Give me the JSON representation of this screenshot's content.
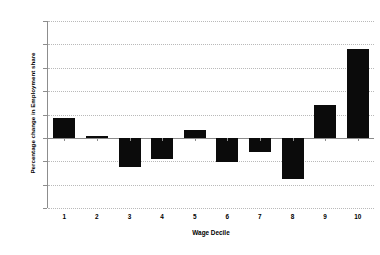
{
  "chart_data": {
    "type": "bar",
    "title": "",
    "xlabel": "Wage Decile",
    "ylabel": "Percentage change in Employment share",
    "categories": [
      "1",
      "2",
      "3",
      "4",
      "5",
      "6",
      "7",
      "8",
      "9",
      "10"
    ],
    "values": [
      17,
      1.5,
      -25,
      -18,
      7,
      -21,
      -12,
      -35,
      28.5,
      76
    ],
    "ylim": [
      -60,
      100
    ],
    "yticks": [
      100,
      80,
      60,
      40,
      20,
      0,
      -20,
      -40,
      -60
    ],
    "ytick_labels": [
      "100",
      "80",
      "60",
      "40",
      "20",
      "0",
      "-20",
      "-40",
      "-60"
    ],
    "grid": true,
    "legend": false,
    "bar_color": "#0b0b0b",
    "gridline_color": "#b9b9b9",
    "axis_color": "#8d8d8d",
    "background_color": "#ffffff"
  }
}
